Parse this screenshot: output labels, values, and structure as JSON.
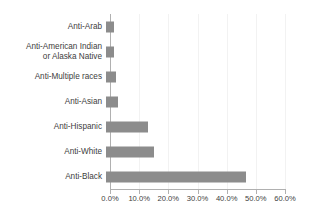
{
  "chart_data": {
    "type": "bar",
    "orientation": "horizontal",
    "title": "",
    "xlabel": "",
    "ylabel": "",
    "categories": [
      "Anti-Arab",
      "Anti-American Indian\nor Alaska Native",
      "Anti-Multiple races",
      "Anti-Asian",
      "Anti-Hispanic",
      "Anti-White",
      "Anti-Black"
    ],
    "values": [
      2.6,
      2.7,
      3.5,
      4.1,
      14.5,
      16.5,
      48.0
    ],
    "value_format": "percent",
    "xlim": [
      0,
      60
    ],
    "xticks": [
      0,
      10,
      20,
      30,
      40,
      50,
      60
    ],
    "xticklabels": [
      "0.0%",
      "10.0%",
      "20.0%",
      "30.0%",
      "40.0%",
      "50.0%",
      "60.0%"
    ],
    "grid": "vertical-faint",
    "legend": "none",
    "bar_color": "#8c8c8c",
    "axis_color": "#b0b0b0",
    "text_color": "#404040",
    "background": "#ffffff"
  }
}
